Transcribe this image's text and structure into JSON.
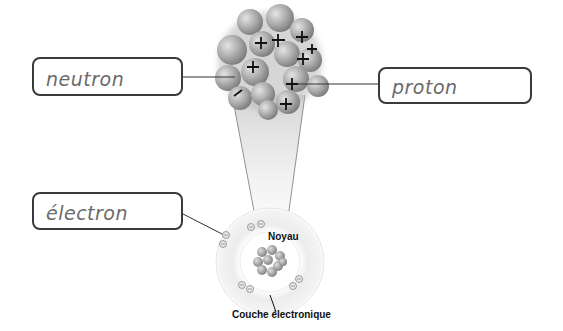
{
  "diagram": {
    "title": "",
    "labels": {
      "neutron": "neutron",
      "proton": "proton",
      "electron": "électron"
    },
    "captions": {
      "nucleus": "Noyau",
      "shell": "Couche électronique"
    },
    "nucleus_zoom": {
      "charge_symbol_proton": "+",
      "charge_symbol_electron": "−",
      "proton_count_visible": 8
    },
    "atom": {
      "electron_count_visible": 10
    },
    "colors": {
      "box_border": "#3a3a3a",
      "handwriting": "#6a6a6a",
      "sphere": "#a8a8a8",
      "shell": "#e6e6e6"
    }
  }
}
